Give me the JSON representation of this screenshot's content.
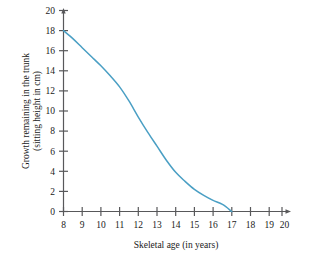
{
  "chart_data": {
    "type": "line",
    "title": "",
    "xlabel": "Skeletal age (in years)",
    "ylabel": "Growth remaining in the trunk (sitting height in cm)",
    "ylabel_line1": "Growth remaining in the trunk",
    "ylabel_line2": "(sitting height in cm)",
    "xlim": [
      8,
      20
    ],
    "ylim": [
      0,
      20
    ],
    "xticks": [
      8,
      9,
      10,
      11,
      12,
      13,
      14,
      15,
      16,
      17,
      18,
      19,
      20
    ],
    "yticks": [
      0,
      2,
      4,
      6,
      8,
      10,
      12,
      14,
      16,
      18,
      20
    ],
    "xtick_labels": [
      "8",
      "9",
      "10",
      "11",
      "12",
      "13",
      "14",
      "15",
      "16",
      "17",
      "18",
      "19",
      "20"
    ],
    "ytick_labels": [
      "0",
      "2",
      "4",
      "6",
      "8",
      "10",
      "12",
      "14",
      "16",
      "18",
      "20"
    ],
    "grid": false,
    "legend": "none",
    "series": [
      {
        "name": "Growth remaining in trunk",
        "color": "#4a9fc4",
        "x": [
          8,
          8.5,
          9,
          9.5,
          10,
          10.5,
          11,
          11.5,
          12,
          12.5,
          13,
          13.5,
          14,
          14.5,
          15,
          15.5,
          16,
          16.5,
          17
        ],
        "values": [
          18,
          17.2,
          16.3,
          15.4,
          14.5,
          13.5,
          12.4,
          11.0,
          9.4,
          7.9,
          6.5,
          5.1,
          3.9,
          3.0,
          2.2,
          1.6,
          1.1,
          0.7,
          0.0
        ]
      }
    ],
    "annotations": []
  }
}
